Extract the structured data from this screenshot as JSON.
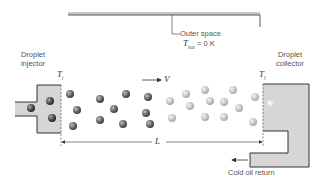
{
  "labels": {
    "injector_line1": "Droplet",
    "injector_line2": "injector",
    "collector_line1": "Droplet",
    "collector_line2": "collector",
    "outer_space": "Outer space",
    "t_sur_symbol": "T",
    "t_sur_sub": "sur",
    "t_sur_value": "= 0 K",
    "t_i_symbol": "T",
    "t_i_sub": "i",
    "t_f_symbol": "T",
    "t_f_sub": "f",
    "velocity": "V",
    "length": "L",
    "cold_oil_return": "Cold oil return"
  },
  "colors": {
    "fill": "#d6d6d6",
    "stroke": "#333333",
    "hot_droplet": "#6a6a6a",
    "cool_droplet": "#c4c4c4"
  },
  "droplets": {
    "injector": [
      [
        31,
        108
      ],
      [
        50,
        101
      ],
      [
        52,
        118
      ]
    ],
    "hot": [
      [
        70,
        94
      ],
      [
        77,
        110
      ],
      [
        73,
        126
      ],
      [
        100,
        99
      ],
      [
        100,
        120
      ],
      [
        114,
        109
      ],
      [
        126,
        94
      ],
      [
        123,
        124
      ],
      [
        148,
        97
      ],
      [
        146,
        113
      ],
      [
        150,
        124
      ]
    ],
    "cool": [
      [
        170,
        101
      ],
      [
        186,
        94
      ],
      [
        190,
        106
      ],
      [
        172,
        118
      ],
      [
        205,
        90
      ],
      [
        210,
        101
      ],
      [
        205,
        117
      ],
      [
        224,
        102
      ],
      [
        233,
        90
      ],
      [
        239,
        108
      ],
      [
        224,
        117
      ],
      [
        255,
        97
      ],
      [
        253,
        122
      ]
    ],
    "collector": [
      [
        271,
        104
      ]
    ]
  }
}
